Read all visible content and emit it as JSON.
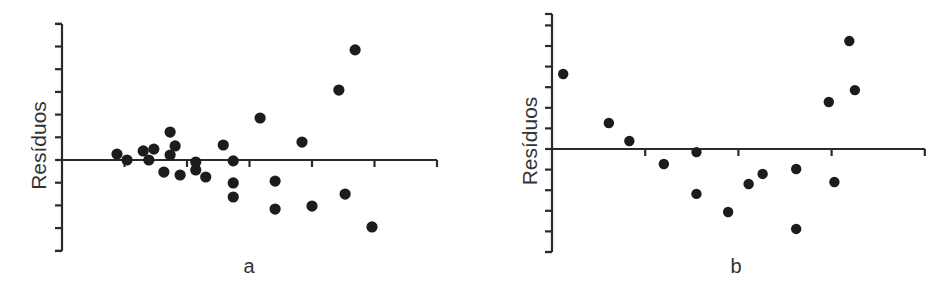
{
  "chart_data": [
    {
      "id": "a",
      "type": "scatter",
      "title": "",
      "xlabel": "a",
      "ylabel": "Resíduos",
      "grid": false,
      "legend": null,
      "xlim": [
        0,
        6
      ],
      "ylim": [
        -4,
        6
      ],
      "x_ticks": [
        1,
        2,
        3,
        4,
        5,
        6
      ],
      "y_ticks": [
        -4,
        -3,
        -2,
        -1,
        0,
        1,
        2,
        3,
        4,
        5,
        6
      ],
      "tick_labels_shown": false,
      "zero_line": true,
      "points": [
        {
          "x": 0.88,
          "y": 0.26
        },
        {
          "x": 1.04,
          "y": 0.0
        },
        {
          "x": 1.3,
          "y": 0.4
        },
        {
          "x": 1.39,
          "y": 0.0
        },
        {
          "x": 1.47,
          "y": 0.48
        },
        {
          "x": 1.63,
          "y": -0.53
        },
        {
          "x": 1.73,
          "y": 1.23
        },
        {
          "x": 1.73,
          "y": 0.22
        },
        {
          "x": 1.81,
          "y": 0.62
        },
        {
          "x": 1.89,
          "y": -0.66
        },
        {
          "x": 2.14,
          "y": -0.09
        },
        {
          "x": 2.14,
          "y": -0.44
        },
        {
          "x": 2.3,
          "y": -0.75
        },
        {
          "x": 2.58,
          "y": 0.66
        },
        {
          "x": 2.74,
          "y": -0.04
        },
        {
          "x": 2.74,
          "y": -1.01
        },
        {
          "x": 2.74,
          "y": -1.63
        },
        {
          "x": 3.17,
          "y": 1.85
        },
        {
          "x": 3.41,
          "y": -0.93
        },
        {
          "x": 3.41,
          "y": -2.16
        },
        {
          "x": 3.84,
          "y": 0.79
        },
        {
          "x": 4.0,
          "y": -2.03
        },
        {
          "x": 4.43,
          "y": 3.08
        },
        {
          "x": 4.53,
          "y": -1.5
        },
        {
          "x": 4.69,
          "y": 4.85
        },
        {
          "x": 4.96,
          "y": -2.95
        }
      ]
    },
    {
      "id": "b",
      "type": "scatter",
      "title": "",
      "xlabel": "b",
      "ylabel": "Resíduos",
      "grid": false,
      "legend": null,
      "xlim": [
        0,
        4
      ],
      "ylim": [
        -5,
        6
      ],
      "x_ticks": [
        1,
        2,
        3,
        4
      ],
      "y_ticks": [
        -5,
        -4,
        -3,
        -2,
        -1,
        0,
        1,
        2,
        3,
        4,
        5,
        6
      ],
      "tick_labels_shown": false,
      "zero_line": true,
      "points": [
        {
          "x": 0.12,
          "y": 3.64
        },
        {
          "x": 0.61,
          "y": 1.26
        },
        {
          "x": 0.83,
          "y": 0.39
        },
        {
          "x": 1.2,
          "y": -0.73
        },
        {
          "x": 1.55,
          "y": -0.15
        },
        {
          "x": 1.55,
          "y": -2.18
        },
        {
          "x": 1.89,
          "y": -3.06
        },
        {
          "x": 2.11,
          "y": -1.7
        },
        {
          "x": 2.26,
          "y": -1.21
        },
        {
          "x": 2.62,
          "y": -0.97
        },
        {
          "x": 2.62,
          "y": -3.88
        },
        {
          "x": 2.97,
          "y": 2.28
        },
        {
          "x": 3.03,
          "y": -1.6
        },
        {
          "x": 3.19,
          "y": 5.24
        },
        {
          "x": 3.25,
          "y": 2.86
        }
      ]
    }
  ]
}
